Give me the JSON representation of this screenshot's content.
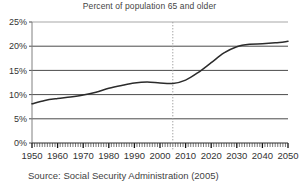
{
  "chart_data": {
    "type": "line",
    "title": "Percent of population 65 and older",
    "xlabel": "",
    "ylabel": "",
    "xlim": [
      1950,
      2050
    ],
    "ylim": [
      0,
      25
    ],
    "grid": true,
    "legend": null,
    "x_ticks": [
      1950,
      1960,
      1970,
      1980,
      1990,
      2000,
      2010,
      2020,
      2030,
      2040,
      2050
    ],
    "x_tick_labels": [
      "1950",
      "1960",
      "1970",
      "1980",
      "1990",
      "2000",
      "2010",
      "2020",
      "2030",
      "2040",
      "2050"
    ],
    "y_ticks": [
      0,
      5,
      10,
      15,
      20,
      25
    ],
    "y_tick_labels": [
      "0%",
      "5%",
      "10%",
      "15%",
      "20%",
      "25%"
    ],
    "minor_x_tick_interval": 1,
    "annotations": [
      {
        "type": "vertical-line",
        "name": "projection-divider",
        "x": 2005,
        "style": "dotted",
        "label": ""
      }
    ],
    "series": [
      {
        "name": "Percent of population 65 and older",
        "color": "#2b2b2b",
        "x": [
          1950,
          1955,
          1960,
          1965,
          1970,
          1975,
          1980,
          1985,
          1990,
          1995,
          2000,
          2005,
          2010,
          2015,
          2020,
          2025,
          2030,
          2035,
          2040,
          2045,
          2050
        ],
        "values": [
          8.1,
          8.8,
          9.2,
          9.5,
          9.9,
          10.5,
          11.3,
          11.9,
          12.4,
          12.6,
          12.4,
          12.3,
          13.0,
          14.6,
          16.6,
          18.6,
          19.9,
          20.4,
          20.5,
          20.7,
          21.0
        ]
      }
    ]
  },
  "caption": {
    "source_text": "Source: Social Security Administration (2005)"
  }
}
